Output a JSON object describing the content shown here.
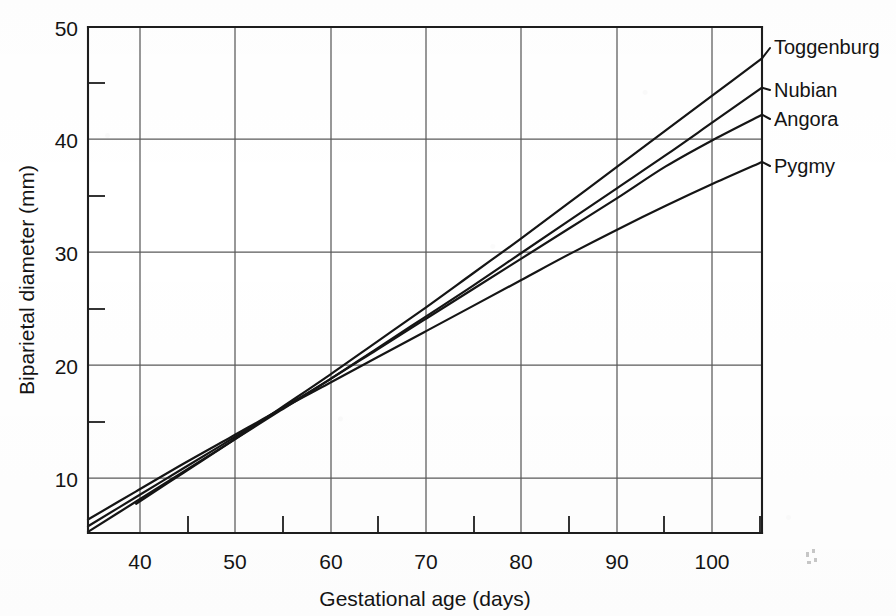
{
  "figure": {
    "background_color": "#ffffff",
    "ink_color": "#151515",
    "grid_color": "#5a5a5a"
  },
  "chart_data": {
    "type": "line",
    "title": "",
    "subtitle": "",
    "xlabel": "Gestational age (days)",
    "ylabel": "Biparietal diameter (mm)",
    "xlim": [
      35,
      105
    ],
    "ylim": [
      5,
      50
    ],
    "grid": true,
    "legend_position": "right-inline-labels",
    "x_tick_labels": [
      "40",
      "50",
      "60",
      "70",
      "80",
      "90",
      "100"
    ],
    "x_ticks_major": [
      40,
      50,
      60,
      70,
      80,
      90,
      100
    ],
    "x_ticks_minor": [
      45,
      55,
      65,
      75,
      85,
      95,
      105
    ],
    "y_tick_labels": [
      "10",
      "20",
      "30",
      "40",
      "50"
    ],
    "y_ticks_major": [
      10,
      20,
      30,
      40,
      50
    ],
    "y_ticks_minor": [
      15,
      25,
      35,
      45
    ],
    "x": [
      35,
      40,
      45,
      50,
      55,
      60,
      65,
      70,
      75,
      80,
      85,
      90,
      95,
      100,
      105
    ],
    "series": [
      {
        "name": "Toggenburg",
        "label": "Toggenburg",
        "values": [
          4.8,
          7.6,
          10.4,
          13.2,
          16.1,
          19.0,
          22.0,
          25.0,
          28.1,
          31.2,
          34.4,
          37.6,
          40.8,
          44.0,
          47.2
        ]
      },
      {
        "name": "Nubian",
        "label": "Nubian",
        "values": [
          5.1,
          7.8,
          10.5,
          13.2,
          15.9,
          18.6,
          21.4,
          24.2,
          27.0,
          29.9,
          32.8,
          35.7,
          38.6,
          41.6,
          44.6
        ]
      },
      {
        "name": "Angora",
        "label": "Angora",
        "values": [
          5.6,
          8.2,
          10.8,
          13.4,
          16.0,
          18.6,
          21.3,
          24.0,
          26.7,
          29.4,
          32.1,
          34.8,
          37.6,
          40.0,
          42.2
        ]
      },
      {
        "name": "Pygmy",
        "label": "Pygmy",
        "values": [
          6.2,
          8.7,
          11.2,
          13.6,
          16.0,
          18.3,
          20.6,
          22.9,
          25.2,
          27.5,
          29.8,
          32.0,
          34.1,
          36.1,
          38.0
        ]
      }
    ]
  },
  "annotations": {
    "series_callouts": [
      "Toggenburg",
      "Nubian",
      "Angora",
      "Pygmy"
    ]
  }
}
